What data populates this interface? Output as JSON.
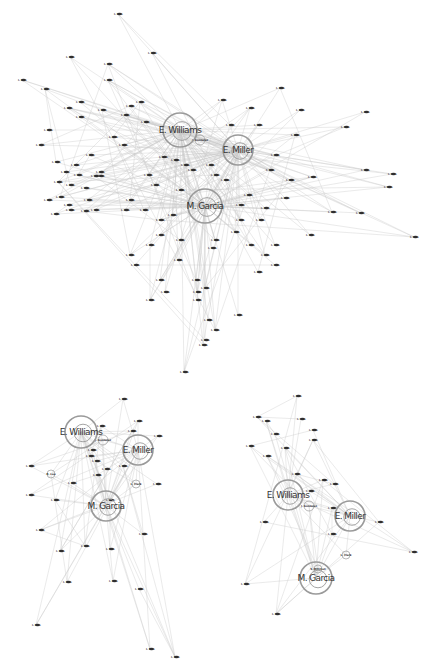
{
  "figure": {
    "background": "#ffffff",
    "edge_color": "#c8c8c8",
    "ring_color": "#9a9a9a",
    "label_color": "#333333"
  },
  "panels": [
    {
      "id": "top",
      "hubs": [
        {
          "label": "E. Williams",
          "x": 180,
          "y": 130,
          "r": 17
        },
        {
          "label": "E. Miller",
          "x": 238,
          "y": 150,
          "r": 15
        },
        {
          "label": "M. Garcia",
          "x": 205,
          "y": 206,
          "r": 17
        }
      ],
      "minor_hubs": [
        {
          "label": "J. Gonzalez",
          "x": 200,
          "y": 140,
          "r": 5
        }
      ],
      "nodes": [
        {
          "label": "I. Ghn",
          "x": 118,
          "y": 14
        },
        {
          "label": "I. Ghn",
          "x": 152,
          "y": 53
        },
        {
          "label": "I. Ghn",
          "x": 70,
          "y": 57
        },
        {
          "label": "I. Ghn",
          "x": 108,
          "y": 64
        },
        {
          "label": "I. Ghn",
          "x": 22,
          "y": 80
        },
        {
          "label": "I. Ghn",
          "x": 45,
          "y": 89
        },
        {
          "label": "I. Ghn",
          "x": 108,
          "y": 80
        },
        {
          "label": "I. Ghn",
          "x": 80,
          "y": 102
        },
        {
          "label": "I. Ghn",
          "x": 68,
          "y": 108
        },
        {
          "label": "I. Ghn",
          "x": 102,
          "y": 110
        },
        {
          "label": "I. Ghn",
          "x": 80,
          "y": 117
        },
        {
          "label": "I. Ghn",
          "x": 130,
          "y": 106
        },
        {
          "label": "I. Ghn",
          "x": 125,
          "y": 115
        },
        {
          "label": "I. Ghn",
          "x": 140,
          "y": 102
        },
        {
          "label": "I. Ghn",
          "x": 145,
          "y": 122
        },
        {
          "label": "I. Ghn",
          "x": 48,
          "y": 130
        },
        {
          "label": "I. Ghn",
          "x": 113,
          "y": 137
        },
        {
          "label": "I. Ghn",
          "x": 123,
          "y": 145
        },
        {
          "label": "I. Ghn",
          "x": 40,
          "y": 145
        },
        {
          "label": "I. Ghn",
          "x": 90,
          "y": 155
        },
        {
          "label": "I. Ghn",
          "x": 56,
          "y": 162
        },
        {
          "label": "I. Ghn",
          "x": 75,
          "y": 165
        },
        {
          "label": "I. Ghn",
          "x": 65,
          "y": 172
        },
        {
          "label": "I. Ghn",
          "x": 78,
          "y": 175
        },
        {
          "label": "I. Ghn",
          "x": 58,
          "y": 182
        },
        {
          "label": "I. Ghn",
          "x": 70,
          "y": 185
        },
        {
          "label": "I. Ghn",
          "x": 85,
          "y": 188
        },
        {
          "label": "I. Ghn",
          "x": 95,
          "y": 176
        },
        {
          "label": "I. Ghn",
          "x": 100,
          "y": 172
        },
        {
          "label": "I. Ghn",
          "x": 48,
          "y": 200
        },
        {
          "label": "I. Ghn",
          "x": 60,
          "y": 197
        },
        {
          "label": "I. Ghn",
          "x": 68,
          "y": 205
        },
        {
          "label": "I. Ghn",
          "x": 88,
          "y": 200
        },
        {
          "label": "I. Ghn",
          "x": 95,
          "y": 210
        },
        {
          "label": "I. Ghn",
          "x": 55,
          "y": 214
        },
        {
          "label": "I. Ghn",
          "x": 70,
          "y": 210
        },
        {
          "label": "I. Ghn",
          "x": 85,
          "y": 211
        },
        {
          "label": "I. Ghn",
          "x": 100,
          "y": 176
        },
        {
          "label": "I. Ghn",
          "x": 130,
          "y": 200
        },
        {
          "label": "I. Ghn",
          "x": 125,
          "y": 210
        },
        {
          "label": "I. Ghn",
          "x": 144,
          "y": 210
        },
        {
          "label": "I. Ghn",
          "x": 148,
          "y": 175
        },
        {
          "label": "I. Ghn",
          "x": 155,
          "y": 185
        },
        {
          "label": "I. Ghn",
          "x": 163,
          "y": 157
        },
        {
          "label": "I. Ghn",
          "x": 175,
          "y": 160
        },
        {
          "label": "I. Ghn",
          "x": 185,
          "y": 165
        },
        {
          "label": "I. Ghn",
          "x": 192,
          "y": 170
        },
        {
          "label": "I. Ghn",
          "x": 210,
          "y": 165
        },
        {
          "label": "I. Ghn",
          "x": 215,
          "y": 175
        },
        {
          "label": "I. Ghn",
          "x": 225,
          "y": 180
        },
        {
          "label": "I. Ghn",
          "x": 230,
          "y": 125
        },
        {
          "label": "I. Ghn",
          "x": 222,
          "y": 100
        },
        {
          "label": "I. Ghn",
          "x": 250,
          "y": 108
        },
        {
          "label": "I. Ghn",
          "x": 280,
          "y": 88
        },
        {
          "label": "I. Ghn",
          "x": 258,
          "y": 125
        },
        {
          "label": "I. Ghn",
          "x": 300,
          "y": 110
        },
        {
          "label": "I. Ghn",
          "x": 295,
          "y": 135
        },
        {
          "label": "I. Ghn",
          "x": 275,
          "y": 155
        },
        {
          "label": "I. Ghn",
          "x": 270,
          "y": 170
        },
        {
          "label": "I. Ghn",
          "x": 290,
          "y": 180
        },
        {
          "label": "I. Ghn",
          "x": 345,
          "y": 127
        },
        {
          "label": "I. Ghn",
          "x": 365,
          "y": 112
        },
        {
          "label": "I. Ghn",
          "x": 312,
          "y": 177
        },
        {
          "label": "I. Ghn",
          "x": 365,
          "y": 170
        },
        {
          "label": "I. Ghn",
          "x": 392,
          "y": 174
        },
        {
          "label": "I. Ghn",
          "x": 388,
          "y": 187
        },
        {
          "label": "I. Ghn",
          "x": 332,
          "y": 212
        },
        {
          "label": "I. Ghn",
          "x": 360,
          "y": 213
        },
        {
          "label": "I. Ghn",
          "x": 414,
          "y": 237
        },
        {
          "label": "I. Ghn",
          "x": 310,
          "y": 235
        },
        {
          "label": "I. Ghn",
          "x": 285,
          "y": 198
        },
        {
          "label": "I. Ghn",
          "x": 265,
          "y": 208
        },
        {
          "label": "I. Ghn",
          "x": 260,
          "y": 220
        },
        {
          "label": "I. Ghn",
          "x": 240,
          "y": 220
        },
        {
          "label": "I. Ghn",
          "x": 235,
          "y": 232
        },
        {
          "label": "I. Ghn",
          "x": 250,
          "y": 245
        },
        {
          "label": "I. Ghn",
          "x": 265,
          "y": 255
        },
        {
          "label": "I. Ghn",
          "x": 275,
          "y": 265
        },
        {
          "label": "I. Ghn",
          "x": 258,
          "y": 272
        },
        {
          "label": "I. Ghn",
          "x": 275,
          "y": 245
        },
        {
          "label": "I. Ghn",
          "x": 215,
          "y": 240
        },
        {
          "label": "I. Ghn",
          "x": 212,
          "y": 248
        },
        {
          "label": "I. Ghn",
          "x": 180,
          "y": 240
        },
        {
          "label": "I. Ghn",
          "x": 160,
          "y": 235
        },
        {
          "label": "I. Ghn",
          "x": 150,
          "y": 245
        },
        {
          "label": "I. Ghn",
          "x": 178,
          "y": 260
        },
        {
          "label": "I. Ghn",
          "x": 160,
          "y": 280
        },
        {
          "label": "I. Ghn",
          "x": 165,
          "y": 292
        },
        {
          "label": "I. Ghn",
          "x": 150,
          "y": 300
        },
        {
          "label": "I. Ghn",
          "x": 196,
          "y": 280
        },
        {
          "label": "I. Ghn",
          "x": 205,
          "y": 288
        },
        {
          "label": "I. Ghn",
          "x": 197,
          "y": 292
        },
        {
          "label": "I. Ghn",
          "x": 197,
          "y": 300
        },
        {
          "label": "I. Ghn",
          "x": 208,
          "y": 320
        },
        {
          "label": "I. Ghn",
          "x": 215,
          "y": 330
        },
        {
          "label": "I. Ghn",
          "x": 205,
          "y": 340
        },
        {
          "label": "I. Ghn",
          "x": 203,
          "y": 345
        },
        {
          "label": "I. Ghn",
          "x": 238,
          "y": 315
        },
        {
          "label": "I. Ghn",
          "x": 184,
          "y": 372
        },
        {
          "label": "I. Ghn",
          "x": 130,
          "y": 255
        },
        {
          "label": "I. Ghn",
          "x": 135,
          "y": 265
        },
        {
          "label": "I. Ghn",
          "x": 248,
          "y": 195
        },
        {
          "label": "I. Ghn",
          "x": 240,
          "y": 205
        },
        {
          "label": "I. Ghn",
          "x": 180,
          "y": 190
        },
        {
          "label": "I. Ghn",
          "x": 172,
          "y": 215
        },
        {
          "label": "I. Ghn",
          "x": 160,
          "y": 220
        }
      ]
    },
    {
      "id": "bottom-left",
      "hubs": [
        {
          "label": "E. Williams",
          "x": 81,
          "y": 432,
          "r": 16
        },
        {
          "label": "E. Miller",
          "x": 138,
          "y": 450,
          "r": 15
        },
        {
          "label": "M. Garcia",
          "x": 106,
          "y": 506,
          "r": 15
        }
      ],
      "minor_hubs": [
        {
          "label": "J. Gonzalez",
          "x": 103,
          "y": 440,
          "r": 5
        },
        {
          "label": "R. Lee",
          "x": 51,
          "y": 474,
          "r": 4
        },
        {
          "label": "L. Clark",
          "x": 136,
          "y": 484,
          "r": 4
        }
      ],
      "nodes": [
        {
          "label": "I. Ghn",
          "x": 123,
          "y": 399
        },
        {
          "label": "I. Ghn",
          "x": 138,
          "y": 421
        },
        {
          "label": "I. Ghn",
          "x": 132,
          "y": 431
        },
        {
          "label": "I. Ghn",
          "x": 158,
          "y": 436
        },
        {
          "label": "I. Ghn",
          "x": 101,
          "y": 426
        },
        {
          "label": "I. Ghn",
          "x": 92,
          "y": 450
        },
        {
          "label": "I. Ghn",
          "x": 90,
          "y": 456
        },
        {
          "label": "I. Ghn",
          "x": 96,
          "y": 461
        },
        {
          "label": "I. Ghn",
          "x": 106,
          "y": 469
        },
        {
          "label": "I. Ghn",
          "x": 123,
          "y": 466
        },
        {
          "label": "I. Ghn",
          "x": 97,
          "y": 475
        },
        {
          "label": "I. Ghn",
          "x": 72,
          "y": 483
        },
        {
          "label": "I. Ghn",
          "x": 30,
          "y": 466
        },
        {
          "label": "I. Ghn",
          "x": 30,
          "y": 495
        },
        {
          "label": "I. Ghn",
          "x": 55,
          "y": 500
        },
        {
          "label": "I. Ghn",
          "x": 157,
          "y": 484
        },
        {
          "label": "I. Ghn",
          "x": 40,
          "y": 530
        },
        {
          "label": "I. Ghn",
          "x": 60,
          "y": 551
        },
        {
          "label": "I. Ghn",
          "x": 85,
          "y": 546
        },
        {
          "label": "I. Ghn",
          "x": 110,
          "y": 549
        },
        {
          "label": "I. Ghn",
          "x": 143,
          "y": 534
        },
        {
          "label": "I. Ghn",
          "x": 67,
          "y": 582
        },
        {
          "label": "I. Ghn",
          "x": 113,
          "y": 581
        },
        {
          "label": "I. Ghn",
          "x": 139,
          "y": 589
        },
        {
          "label": "I. Ghn",
          "x": 36,
          "y": 625
        },
        {
          "label": "I. Ghn",
          "x": 150,
          "y": 649
        },
        {
          "label": "I. Ghn",
          "x": 175,
          "y": 657
        },
        {
          "label": "I. Ghn",
          "x": 110,
          "y": 500
        }
      ]
    },
    {
      "id": "bottom-right",
      "hubs": [
        {
          "label": "E. Williams",
          "x": 288,
          "y": 495,
          "r": 15
        },
        {
          "label": "E. Miller",
          "x": 350,
          "y": 516,
          "r": 15
        },
        {
          "label": "M. Garcia",
          "x": 316,
          "y": 578,
          "r": 16
        }
      ],
      "minor_hubs": [
        {
          "label": "J. Gonzalez",
          "x": 309,
          "y": 506,
          "r": 5
        },
        {
          "label": "L. Clark",
          "x": 346,
          "y": 555,
          "r": 4
        },
        {
          "label": "S. Mitchell",
          "x": 318,
          "y": 569,
          "r": 4
        }
      ],
      "nodes": [
        {
          "label": "I. Ghn",
          "x": 297,
          "y": 396
        },
        {
          "label": "I. Ghn",
          "x": 257,
          "y": 417
        },
        {
          "label": "I. Ghn",
          "x": 266,
          "y": 421
        },
        {
          "label": "I. Ghn",
          "x": 301,
          "y": 419
        },
        {
          "label": "I. Ghn",
          "x": 313,
          "y": 430
        },
        {
          "label": "I. Ghn",
          "x": 275,
          "y": 434
        },
        {
          "label": "I. Ghn",
          "x": 313,
          "y": 440
        },
        {
          "label": "I. Ghn",
          "x": 250,
          "y": 446
        },
        {
          "label": "I. Ghn",
          "x": 285,
          "y": 448
        },
        {
          "label": "I. Ghn",
          "x": 267,
          "y": 456
        },
        {
          "label": "I. Ghn",
          "x": 296,
          "y": 474
        },
        {
          "label": "I. Ghn",
          "x": 323,
          "y": 480
        },
        {
          "label": "I. Ghn",
          "x": 334,
          "y": 484
        },
        {
          "label": "I. Ghn",
          "x": 310,
          "y": 491
        },
        {
          "label": "I. Ghn",
          "x": 332,
          "y": 508
        },
        {
          "label": "I. Ghn",
          "x": 264,
          "y": 522
        },
        {
          "label": "I. Ghn",
          "x": 379,
          "y": 522
        },
        {
          "label": "I. Ghn",
          "x": 332,
          "y": 534
        },
        {
          "label": "I. Ghn",
          "x": 413,
          "y": 552
        },
        {
          "label": "I. Ghn",
          "x": 245,
          "y": 584
        },
        {
          "label": "I. Ghn",
          "x": 276,
          "y": 614
        }
      ]
    }
  ]
}
